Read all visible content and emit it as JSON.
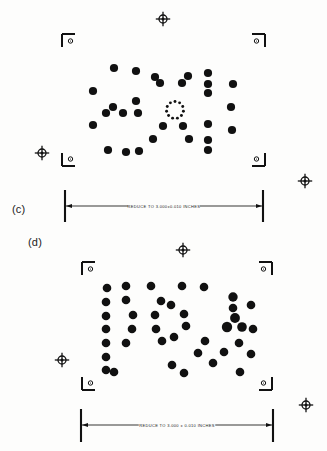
{
  "figure": {
    "background_color": "#fdfdfc",
    "ink_color": "#111111",
    "panels": [
      {
        "id": "panel-c",
        "label": "(c)",
        "dimension_note": "REDUCE TO 3.000±0.010 INCHES",
        "frame": {
          "left": 62,
          "top": 32,
          "right": 265,
          "bottom": 168
        },
        "corner_marks": [
          {
            "name": "corner-mark-top-left",
            "corner": "tl",
            "x": 62,
            "y": 34
          },
          {
            "name": "corner-mark-top-right",
            "corner": "tr",
            "x": 265,
            "y": 34
          },
          {
            "name": "corner-mark-bottom-left",
            "corner": "bl",
            "x": 62,
            "y": 166
          },
          {
            "name": "corner-mark-bottom-right",
            "corner": "br",
            "x": 265,
            "y": 166
          }
        ],
        "registration_targets": [
          {
            "name": "registration-target-top",
            "x": 163,
            "y": 19
          },
          {
            "name": "registration-target-left",
            "x": 42,
            "y": 153
          },
          {
            "name": "registration-target-right",
            "x": 305,
            "y": 181
          }
        ],
        "dimension_line": {
          "left": 65,
          "right": 263,
          "y": 206,
          "tick_top": 190,
          "tick_bottom": 222
        },
        "dots": [
          {
            "x": 114,
            "y": 68,
            "r": 4.1
          },
          {
            "x": 136,
            "y": 71,
            "r": 4.1
          },
          {
            "x": 155,
            "y": 77,
            "r": 4.1
          },
          {
            "x": 188,
            "y": 76,
            "r": 4.1
          },
          {
            "x": 208,
            "y": 73,
            "r": 4.1
          },
          {
            "x": 208,
            "y": 84,
            "r": 4.1
          },
          {
            "x": 208,
            "y": 93,
            "r": 4.1
          },
          {
            "x": 233,
            "y": 84,
            "r": 4.1
          },
          {
            "x": 160,
            "y": 83,
            "r": 4.1
          },
          {
            "x": 182,
            "y": 83,
            "r": 4.1
          },
          {
            "x": 93,
            "y": 91,
            "r": 4.1
          },
          {
            "x": 136,
            "y": 101,
            "r": 4.1
          },
          {
            "x": 138,
            "y": 113,
            "r": 4.1
          },
          {
            "x": 113,
            "y": 107,
            "r": 4.1
          },
          {
            "x": 106,
            "y": 113,
            "r": 4.1
          },
          {
            "x": 123,
            "y": 113,
            "r": 4.1
          },
          {
            "x": 231,
            "y": 107,
            "r": 4.1
          },
          {
            "x": 93,
            "y": 125,
            "r": 4.1
          },
          {
            "x": 163,
            "y": 126,
            "r": 4.1
          },
          {
            "x": 183,
            "y": 126,
            "r": 4.1
          },
          {
            "x": 208,
            "y": 124,
            "r": 4.1
          },
          {
            "x": 232,
            "y": 130,
            "r": 4.1
          },
          {
            "x": 153,
            "y": 139,
            "r": 4.1
          },
          {
            "x": 189,
            "y": 139,
            "r": 4.1
          },
          {
            "x": 208,
            "y": 140,
            "r": 4.1
          },
          {
            "x": 208,
            "y": 150,
            "r": 4.1
          },
          {
            "x": 108,
            "y": 150,
            "r": 4.1
          },
          {
            "x": 126,
            "y": 152,
            "r": 4.1
          },
          {
            "x": 139,
            "y": 151,
            "r": 4.1
          }
        ],
        "center_ring": {
          "name": "center-ring-of-small-dots",
          "cx": 175,
          "cy": 110,
          "radius": 8.5,
          "dot_radius": 1.45,
          "count": 11
        }
      },
      {
        "id": "panel-d",
        "label": "(d)",
        "dimension_note": "REDUCE TO 3.000 ± 0.010 INCHES",
        "frame": {
          "left": 80,
          "top": 258,
          "right": 275,
          "bottom": 390
        },
        "corner_marks": [
          {
            "name": "corner-mark-top-left",
            "corner": "tl",
            "x": 82,
            "y": 262
          },
          {
            "name": "corner-mark-top-right",
            "corner": "tr",
            "x": 272,
            "y": 262
          },
          {
            "name": "corner-mark-bottom-left",
            "corner": "bl",
            "x": 82,
            "y": 390
          },
          {
            "name": "corner-mark-bottom-right",
            "corner": "br",
            "x": 272,
            "y": 390
          }
        ],
        "registration_targets": [
          {
            "name": "registration-target-top",
            "x": 183,
            "y": 250
          },
          {
            "name": "registration-target-left",
            "x": 62,
            "y": 360
          },
          {
            "name": "registration-target-right",
            "x": 306,
            "y": 405
          }
        ],
        "dimension_line": {
          "left": 81,
          "right": 273,
          "y": 425,
          "tick_top": 409,
          "tick_bottom": 442
        },
        "dots": [
          {
            "x": 107,
            "y": 288,
            "r": 4.3
          },
          {
            "x": 126,
            "y": 286,
            "r": 4.3
          },
          {
            "x": 151,
            "y": 286,
            "r": 4.3
          },
          {
            "x": 182,
            "y": 286,
            "r": 4.3
          },
          {
            "x": 204,
            "y": 287,
            "r": 4.3
          },
          {
            "x": 106,
            "y": 302,
            "r": 4.3
          },
          {
            "x": 126,
            "y": 300,
            "r": 4.3
          },
          {
            "x": 161,
            "y": 301,
            "r": 4.3
          },
          {
            "x": 171,
            "y": 305,
            "r": 4.3
          },
          {
            "x": 233,
            "y": 297,
            "r": 4.7
          },
          {
            "x": 233,
            "y": 308,
            "r": 4.3
          },
          {
            "x": 251,
            "y": 305,
            "r": 4.3
          },
          {
            "x": 106,
            "y": 316,
            "r": 4.3
          },
          {
            "x": 133,
            "y": 315,
            "r": 4.3
          },
          {
            "x": 155,
            "y": 315,
            "r": 4.3
          },
          {
            "x": 184,
            "y": 314,
            "r": 4.3
          },
          {
            "x": 235,
            "y": 318,
            "r": 4.9
          },
          {
            "x": 106,
            "y": 329,
            "r": 4.3
          },
          {
            "x": 132,
            "y": 329,
            "r": 4.3
          },
          {
            "x": 156,
            "y": 329,
            "r": 4.3
          },
          {
            "x": 186,
            "y": 326,
            "r": 4.3
          },
          {
            "x": 227,
            "y": 327,
            "r": 5.2
          },
          {
            "x": 242,
            "y": 327,
            "r": 4.8
          },
          {
            "x": 253,
            "y": 329,
            "r": 4.3
          },
          {
            "x": 106,
            "y": 343,
            "r": 4.3
          },
          {
            "x": 126,
            "y": 343,
            "r": 4.3
          },
          {
            "x": 162,
            "y": 341,
            "r": 4.3
          },
          {
            "x": 174,
            "y": 337,
            "r": 4.3
          },
          {
            "x": 205,
            "y": 341,
            "r": 4.3
          },
          {
            "x": 239,
            "y": 343,
            "r": 4.3
          },
          {
            "x": 106,
            "y": 357,
            "r": 4.3
          },
          {
            "x": 198,
            "y": 353,
            "r": 4.3
          },
          {
            "x": 224,
            "y": 352,
            "r": 4.3
          },
          {
            "x": 251,
            "y": 354,
            "r": 4.3
          },
          {
            "x": 106,
            "y": 370,
            "r": 4.3
          },
          {
            "x": 114,
            "y": 372,
            "r": 4.3
          },
          {
            "x": 172,
            "y": 365,
            "r": 4.3
          },
          {
            "x": 213,
            "y": 363,
            "r": 4.3
          },
          {
            "x": 184,
            "y": 373,
            "r": 4.3
          },
          {
            "x": 240,
            "y": 372,
            "r": 4.3
          }
        ]
      }
    ]
  }
}
